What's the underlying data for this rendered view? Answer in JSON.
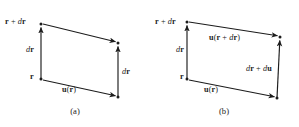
{
  "figure": {
    "background_color": "#ffffff",
    "ink_color": "#1c1c1c",
    "type": "vector-diagram-pair"
  },
  "panels": [
    {
      "id": "a",
      "caption": "(a)",
      "labels": {
        "top_left": {
          "vec1": "r",
          "op": " + ",
          "it1": "d",
          "vec2": "r"
        },
        "left_side": {
          "it1": "d",
          "vec1": "r"
        },
        "origin": {
          "vec1": "r"
        },
        "right_side": {
          "it1": "d",
          "vec1": "r"
        },
        "bottom": {
          "vec1": "u",
          "arg": "(",
          "vec2": "r",
          "argclose": ")"
        }
      },
      "geometry": {
        "vertices": {
          "r": [
            41,
            79
          ],
          "r_plus_dr": [
            41,
            24
          ],
          "bottom_right": [
            118,
            97
          ],
          "top_right": [
            118,
            43
          ]
        },
        "arrows": [
          {
            "name": "dr-left",
            "from": [
              41,
              79
            ],
            "to": [
              41,
              25
            ]
          },
          {
            "name": "u-r",
            "from": [
              44,
              80
            ],
            "to": [
              117,
              96
            ]
          },
          {
            "name": "u-r-top",
            "from": [
              44,
              24
            ],
            "to": [
              117,
              42
            ]
          },
          {
            "name": "dr-right",
            "from": [
              118,
              96
            ],
            "to": [
              118,
              44
            ]
          }
        ]
      }
    },
    {
      "id": "b",
      "caption": "(b)",
      "labels": {
        "top_left": {
          "vec1": "r",
          "op": " + ",
          "it1": "d",
          "vec2": "r"
        },
        "left_side": {
          "it1": "d",
          "vec1": "r"
        },
        "origin": {
          "vec1": "r"
        },
        "top_arrow": {
          "vec1": "u",
          "arg": "(",
          "vec2": "r",
          "op": " + ",
          "it1": "d",
          "vec3": "r",
          "argclose": ")"
        },
        "right_side": {
          "it1": "d",
          "vec1": "r",
          "op": " + ",
          "it2": "d",
          "vec2": "u"
        },
        "bottom": {
          "vec1": "u",
          "arg": "(",
          "vec2": "r",
          "argclose": ")"
        }
      },
      "geometry": {
        "vertices": {
          "r": [
            38,
            79
          ],
          "r_plus_dr": [
            38,
            22
          ],
          "bottom_right": [
            128,
            98
          ],
          "top_right": [
            131,
            37
          ]
        },
        "arrows": [
          {
            "name": "dr-left",
            "from": [
              38,
              79
            ],
            "to": [
              38,
              23
            ]
          },
          {
            "name": "u-r",
            "from": [
              41,
              80
            ],
            "to": [
              127,
              97
            ]
          },
          {
            "name": "u-r-plus-dr",
            "from": [
              41,
              22
            ],
            "to": [
              130,
              36
            ]
          },
          {
            "name": "dr-plus-du",
            "from": [
              128,
              97
            ],
            "to": [
              131,
              38
            ]
          }
        ]
      }
    }
  ],
  "text": {
    "panel_a_caption": "(a)",
    "panel_b_caption": "(b)",
    "a_r_plus_dr": "r + dr",
    "a_dr_left": "dr",
    "a_r": "r",
    "a_dr_right": "dr",
    "a_u_r": "u(r)",
    "b_r_plus_dr": "r + dr",
    "b_dr_left": "dr",
    "b_r": "r",
    "b_u_r_plus_dr": "u(r + dr)",
    "b_dr_plus_du": "dr + du",
    "b_u_r": "u(r)"
  }
}
